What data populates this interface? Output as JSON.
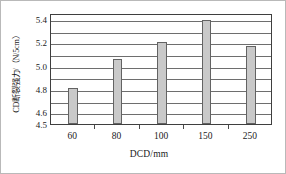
{
  "chart_data": {
    "type": "bar",
    "title": "",
    "subtitle": "",
    "xlabel": "DCD/mm",
    "ylabel": "CD断裂强力/（N/5cm）",
    "categories": [
      "60",
      "80",
      "100",
      "150",
      "250"
    ],
    "values": [
      4.81,
      5.06,
      5.2,
      5.39,
      5.17
    ],
    "series": [
      {
        "name": "CD断裂强力",
        "values": [
          4.81,
          5.06,
          5.2,
          5.39,
          5.17
        ]
      }
    ],
    "ylim": [
      4.5,
      5.45
    ],
    "xlim": [
      0,
      5
    ],
    "y_tick_labels": [
      "4.5",
      "4.6",
      "4.8",
      "5.0",
      "5.2",
      "5.4"
    ],
    "y_tick_values": [
      4.5,
      4.6,
      4.8,
      5.0,
      5.2,
      5.4
    ],
    "gridlines": [
      4.6,
      4.7,
      4.8,
      4.9,
      5.0,
      5.1,
      5.2,
      5.3,
      5.4
    ],
    "grid": "horizontal",
    "legend": "none",
    "bar_fill_color": "#c9c9c9",
    "bar_edge_color": "#636363",
    "grid_color": "#6e6e6e",
    "frame_color": "#3f3f3f",
    "text_color": "#1a1a1a",
    "bar_width_fraction": 0.22
  }
}
